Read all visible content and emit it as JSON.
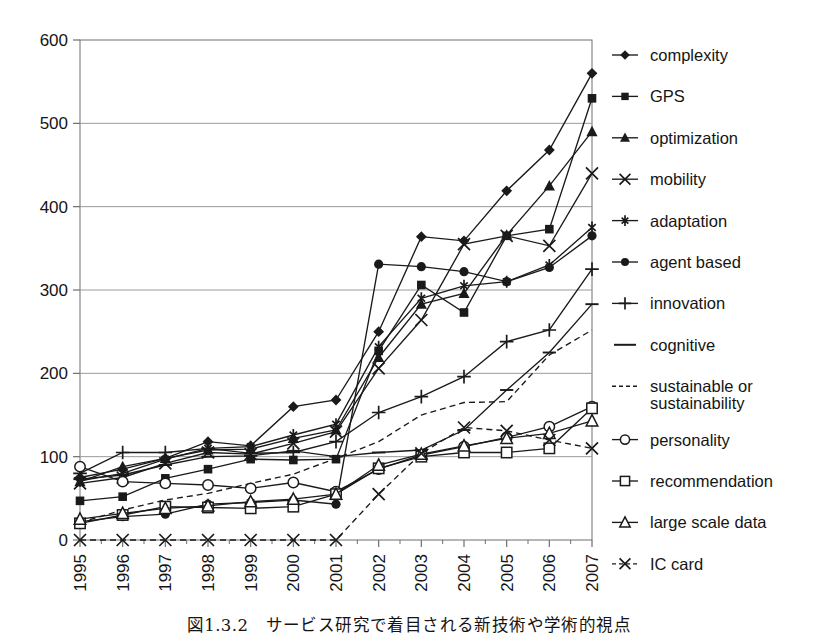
{
  "caption": "図1.3.2　サービス研究で着目される新技術や学術的視点",
  "axes": {
    "y_ticks": [
      "0",
      "100",
      "200",
      "300",
      "400",
      "500",
      "600"
    ],
    "x_ticks": [
      "1995",
      "1996",
      "1997",
      "1998",
      "1999",
      "2000",
      "2001",
      "2002",
      "2003",
      "2004",
      "2005",
      "2006",
      "2007"
    ],
    "ylim": [
      0,
      600
    ],
    "y_interval": 100,
    "grid": "horizontal",
    "xlabel": "",
    "ylabel": ""
  },
  "colors": {
    "line": "#1a1a1a",
    "grid": "#9a9a9a",
    "axis": "#6e6e6e",
    "background": "#ffffff"
  },
  "legend": {
    "position": "right",
    "entries": [
      {
        "label": "complexity",
        "marker": "filled-diamond",
        "dash": "solid"
      },
      {
        "label": "GPS",
        "marker": "filled-square",
        "dash": "solid"
      },
      {
        "label": "optimization",
        "marker": "filled-triangle",
        "dash": "solid"
      },
      {
        "label": "mobility",
        "marker": "cross-x",
        "dash": "solid"
      },
      {
        "label": "adaptation",
        "marker": "asterisk",
        "dash": "solid"
      },
      {
        "label": "agent based",
        "marker": "filled-circle",
        "dash": "solid"
      },
      {
        "label": "innovation",
        "marker": "plus",
        "dash": "solid"
      },
      {
        "label": "cognitive",
        "marker": "dash",
        "dash": "solid"
      },
      {
        "label": "sustainable or\nsustainability",
        "marker": "none",
        "dash": "dashed"
      },
      {
        "label": "personality",
        "marker": "open-circle",
        "dash": "solid"
      },
      {
        "label": "recommendation",
        "marker": "open-square",
        "dash": "solid"
      },
      {
        "label": "large scale data",
        "marker": "open-triangle",
        "dash": "solid"
      },
      {
        "label": "IC card",
        "marker": "cross-x",
        "dash": "dashed"
      }
    ]
  },
  "chart_data": {
    "type": "line",
    "title": "",
    "xlabel": "",
    "ylabel": "",
    "ylim": [
      0,
      600
    ],
    "grid": true,
    "legend_position": "right",
    "categories": [
      "1995",
      "1996",
      "1997",
      "1998",
      "1999",
      "2000",
      "2001",
      "2002",
      "2003",
      "2004",
      "2005",
      "2006",
      "2007"
    ],
    "series": [
      {
        "name": "complexity",
        "marker": "filled-diamond",
        "dash": "solid",
        "values": [
          75,
          85,
          98,
          118,
          113,
          160,
          168,
          250,
          364,
          359,
          419,
          468,
          560
        ]
      },
      {
        "name": "GPS",
        "marker": "filled-square",
        "dash": "solid",
        "values": [
          47,
          52,
          74,
          85,
          97,
          96,
          97,
          227,
          306,
          273,
          365,
          373,
          530
        ]
      },
      {
        "name": "optimization",
        "marker": "filled-triangle",
        "dash": "solid",
        "values": [
          70,
          88,
          98,
          108,
          109,
          122,
          132,
          219,
          283,
          296,
          366,
          425,
          490
        ]
      },
      {
        "name": "mobility",
        "marker": "cross-x",
        "dash": "solid",
        "values": [
          68,
          75,
          92,
          105,
          103,
          116,
          130,
          206,
          264,
          355,
          365,
          353,
          440
        ]
      },
      {
        "name": "adaptation",
        "marker": "asterisk",
        "dash": "solid",
        "values": [
          71,
          80,
          97,
          110,
          112,
          126,
          139,
          232,
          290,
          305,
          310,
          330,
          375
        ]
      },
      {
        "name": "agent based",
        "marker": "filled-circle",
        "dash": "solid",
        "values": [
          22,
          28,
          31,
          43,
          45,
          48,
          43,
          331,
          328,
          322,
          310,
          327,
          365
        ]
      },
      {
        "name": "innovation",
        "marker": "plus",
        "dash": "solid",
        "values": [
          80,
          105,
          105,
          110,
          104,
          105,
          118,
          153,
          172,
          196,
          238,
          252,
          325
        ]
      },
      {
        "name": "cognitive",
        "marker": "dash",
        "dash": "solid",
        "values": [
          73,
          78,
          90,
          100,
          101,
          107,
          100,
          105,
          108,
          132,
          180,
          225,
          283
        ]
      },
      {
        "name": "sustainable or sustainability",
        "marker": "none",
        "dash": "dashed",
        "values": [
          21,
          36,
          48,
          56,
          68,
          79,
          98,
          118,
          150,
          165,
          166,
          222,
          252
        ]
      },
      {
        "name": "personality",
        "marker": "open-circle",
        "dash": "solid",
        "values": [
          88,
          70,
          68,
          66,
          62,
          69,
          58,
          85,
          102,
          112,
          123,
          136,
          160
        ]
      },
      {
        "name": "recommendation",
        "marker": "open-square",
        "dash": "solid",
        "values": [
          20,
          30,
          40,
          39,
          38,
          40,
          55,
          86,
          100,
          105,
          105,
          110,
          158
        ]
      },
      {
        "name": "large scale data",
        "marker": "open-triangle",
        "dash": "solid",
        "values": [
          25,
          32,
          38,
          41,
          46,
          49,
          55,
          90,
          103,
          113,
          122,
          128,
          143
        ]
      },
      {
        "name": "IC card",
        "marker": "cross-x",
        "dash": "dashed",
        "values": [
          0,
          0,
          0,
          0,
          0,
          0,
          0,
          55,
          104,
          135,
          131,
          120,
          110
        ]
      }
    ]
  }
}
